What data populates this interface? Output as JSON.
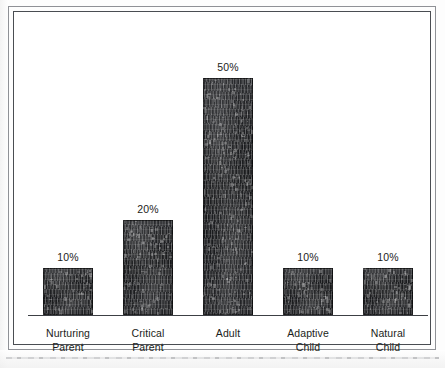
{
  "figure": {
    "background_color": "#ffffff",
    "frame_color": "#4a4d52",
    "bar_color": "#1c1d1f",
    "text_color": "#1b1d20"
  },
  "chart_data": {
    "type": "bar",
    "title": "",
    "subtitle": "",
    "xlabel": "",
    "ylabel": "",
    "ylim": [
      0,
      55
    ],
    "grid": false,
    "legend": null,
    "value_label_suffix": "%",
    "categories": [
      "Nurturing Parent",
      "Critical Parent",
      "Adult",
      "Adaptive Child",
      "Natural Child"
    ],
    "values": [
      10,
      20,
      50,
      10,
      10
    ],
    "bars": [
      {
        "category_line1": "Nurturing",
        "category_line2": "Parent",
        "value": 10,
        "value_label": "10%"
      },
      {
        "category_line1": "Critical",
        "category_line2": "Parent",
        "value": 20,
        "value_label": "20%"
      },
      {
        "category_line1": "Adult",
        "category_line2": "",
        "value": 50,
        "value_label": "50%"
      },
      {
        "category_line1": "Adaptive",
        "category_line2": "Child",
        "value": 10,
        "value_label": "10%"
      },
      {
        "category_line1": "Natural",
        "category_line2": "Child",
        "value": 10,
        "value_label": "10%"
      }
    ]
  }
}
